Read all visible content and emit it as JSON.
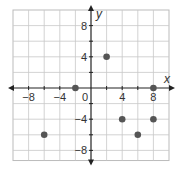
{
  "chart_data": {
    "type": "scatter",
    "title": "",
    "xlabel": "x",
    "ylabel": "y",
    "xlim": [
      -10,
      10
    ],
    "ylim": [
      -9,
      10
    ],
    "grid": true,
    "grid_step": 2,
    "x_tick_labels": [
      "-8",
      "-4",
      "0",
      "4",
      "8"
    ],
    "y_tick_labels": [
      "8",
      "4",
      "-4",
      "-8"
    ],
    "points": [
      {
        "x": -2,
        "y": 0
      },
      {
        "x": 8,
        "y": 0
      },
      {
        "x": 2,
        "y": 4
      },
      {
        "x": -6,
        "y": -6
      },
      {
        "x": 4,
        "y": -4
      },
      {
        "x": 8,
        "y": -4
      },
      {
        "x": 6,
        "y": -6
      }
    ],
    "colors": {
      "grid": "#c8c8c8",
      "axis": "#222222",
      "point": "#555555",
      "border": "#bbbbbb"
    }
  }
}
